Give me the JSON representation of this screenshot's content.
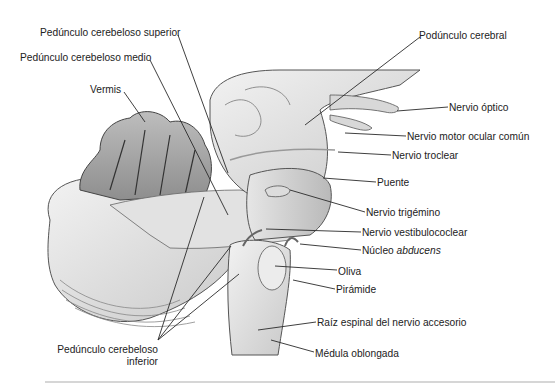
{
  "figure": {
    "line_color": "#2a2a2a",
    "fill_light": "#e9e9e9",
    "fill_mid": "#cfcfcf",
    "fill_dark": "#9a9a9a"
  },
  "labels": [
    {
      "id": "pedunculo-cerebeloso-superior",
      "text": "Pedúnculo cerebeloso superior",
      "x": 40,
      "y": 27,
      "align": "left",
      "line": [
        [
          178,
          35
        ],
        [
          228,
          173
        ]
      ]
    },
    {
      "id": "pedunculo-cerebeloso-medio",
      "text": "Pedúnculo cerebeloso medio",
      "x": 20,
      "y": 52,
      "align": "left",
      "line": [
        [
          150,
          60
        ],
        [
          228,
          215
        ]
      ]
    },
    {
      "id": "vermis",
      "text": "Vermis",
      "x": 90,
      "y": 84,
      "align": "left",
      "line": [
        [
          124,
          92
        ],
        [
          145,
          122
        ]
      ]
    },
    {
      "id": "pedunculo-cerebral",
      "text": "Podúnculo cerebral",
      "x": 419,
      "y": 30,
      "align": "left",
      "line": [
        [
          420,
          37
        ],
        [
          305,
          125
        ]
      ]
    },
    {
      "id": "nervio-optico",
      "text": "Nervio óptico",
      "x": 449,
      "y": 102,
      "align": "left",
      "line": [
        [
          448,
          107
        ],
        [
          397,
          111
        ]
      ]
    },
    {
      "id": "nervio-motor-ocular-comun",
      "text": "Nervio motor ocular común",
      "x": 407,
      "y": 131,
      "align": "left",
      "line": [
        [
          406,
          136
        ],
        [
          345,
          133
        ]
      ]
    },
    {
      "id": "nervio-troclear",
      "text": "Nervio troclear",
      "x": 392,
      "y": 150,
      "align": "left",
      "line": [
        [
          391,
          155
        ],
        [
          338,
          152
        ]
      ]
    },
    {
      "id": "puente",
      "text": "Puente",
      "x": 377,
      "y": 177,
      "align": "left",
      "line": [
        [
          376,
          182
        ],
        [
          323,
          178
        ]
      ]
    },
    {
      "id": "nervio-trigemino",
      "text": "Nervio trigémino",
      "x": 366,
      "y": 207,
      "align": "left",
      "line": [
        [
          365,
          212
        ],
        [
          290,
          190
        ]
      ]
    },
    {
      "id": "nervio-vestibulococlear",
      "text": "Nervio vestibulococlear",
      "x": 362,
      "y": 227,
      "align": "left",
      "line": [
        [
          361,
          232
        ],
        [
          266,
          229
        ]
      ]
    },
    {
      "id": "nucleo-abducens",
      "text": "Núcleo ",
      "italic": "abducens",
      "x": 362,
      "y": 245,
      "align": "left",
      "line": [
        [
          361,
          250
        ],
        [
          300,
          244
        ]
      ]
    },
    {
      "id": "oliva",
      "text": "Oliva",
      "x": 338,
      "y": 266,
      "align": "left",
      "line": [
        [
          337,
          270
        ],
        [
          275,
          266
        ]
      ]
    },
    {
      "id": "piramide",
      "text": "Pirámide",
      "x": 336,
      "y": 284,
      "align": "left",
      "line": [
        [
          335,
          289
        ],
        [
          293,
          280
        ]
      ]
    },
    {
      "id": "raiz-espinal-nervio-accesorio",
      "text": "Raíz espinal del nervio accesorio",
      "x": 317,
      "y": 317,
      "align": "left",
      "line": [
        [
          316,
          322
        ],
        [
          258,
          330
        ]
      ]
    },
    {
      "id": "medula-oblongada",
      "text": "Médula oblongada",
      "x": 315,
      "y": 348,
      "align": "left",
      "line": [
        [
          314,
          352
        ],
        [
          271,
          340
        ]
      ]
    },
    {
      "id": "pedunculo-cerebeloso-inferior",
      "text": "Pedúnculo cerebeloso",
      "text2": "inferior",
      "x": 57,
      "y": 344,
      "align": "right",
      "width": 101,
      "line": [
        [
          158,
          340
        ],
        [
          204,
          197
        ]
      ],
      "extra_lines": [
        [
          [
            158,
            340
          ],
          [
            231,
            246
          ]
        ],
        [
          [
            158,
            340
          ],
          [
            239,
            274
          ]
        ]
      ]
    }
  ]
}
